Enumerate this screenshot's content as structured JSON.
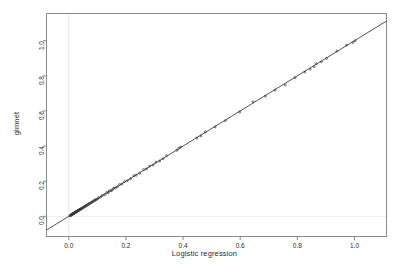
{
  "chart_data": {
    "type": "scatter",
    "title": "",
    "xlabel": "Logistic regression",
    "ylabel": "glmnet",
    "xticks": [
      "0.0",
      "0.2",
      "0.4",
      "0.6",
      "0.8",
      "1.0"
    ],
    "xtickvals": [
      0.0,
      0.2,
      0.4,
      0.6,
      0.8,
      1.0
    ],
    "yticks": [
      "0.0",
      "0.2",
      "0.4",
      "0.6",
      "0.8",
      "1.0"
    ],
    "ytickvals": [
      0.0,
      0.2,
      0.4,
      0.6,
      0.8,
      1.0
    ],
    "xlim": [
      -0.078,
      1.112
    ],
    "ylim": [
      -0.115,
      1.155
    ],
    "grid": false,
    "grid_reference_lines": [
      {
        "axis": "x",
        "value": 0.0,
        "color": "#e8e8e8"
      },
      {
        "axis": "y",
        "value": 0.0,
        "color": "#ededed"
      }
    ],
    "legend": null,
    "point_marker": "open-circle",
    "point_color": "#3a3a3a",
    "point_size_px": 2.0,
    "reference_line": {
      "label": "y = x identity line",
      "slope": 1,
      "intercept": 0,
      "color": "#2a2a2a",
      "width_px": 0.8
    },
    "frame_color": "#8a8a8a",
    "series": [
      {
        "name": "predicted probabilities",
        "x": [
          0.004,
          0.006,
          0.007,
          0.008,
          0.009,
          0.01,
          0.011,
          0.012,
          0.012,
          0.013,
          0.014,
          0.015,
          0.016,
          0.016,
          0.017,
          0.018,
          0.019,
          0.02,
          0.021,
          0.022,
          0.023,
          0.024,
          0.025,
          0.026,
          0.027,
          0.028,
          0.03,
          0.031,
          0.032,
          0.033,
          0.035,
          0.036,
          0.038,
          0.039,
          0.041,
          0.042,
          0.044,
          0.046,
          0.048,
          0.05,
          0.052,
          0.054,
          0.056,
          0.058,
          0.06,
          0.062,
          0.065,
          0.068,
          0.07,
          0.073,
          0.076,
          0.079,
          0.082,
          0.085,
          0.088,
          0.091,
          0.094,
          0.097,
          0.101,
          0.105,
          0.112,
          0.118,
          0.126,
          0.133,
          0.138,
          0.142,
          0.148,
          0.152,
          0.157,
          0.163,
          0.17,
          0.178,
          0.186,
          0.195,
          0.205,
          0.216,
          0.228,
          0.236,
          0.248,
          0.262,
          0.272,
          0.283,
          0.295,
          0.305,
          0.318,
          0.33,
          0.342,
          0.378,
          0.385,
          0.392,
          0.448,
          0.462,
          0.478,
          0.512,
          0.548,
          0.598,
          0.645,
          0.688,
          0.722,
          0.758,
          0.792,
          0.826,
          0.845,
          0.858,
          0.866,
          0.884,
          0.902,
          0.938,
          0.972,
          0.994,
          1.002
        ],
        "y": [
          0.003,
          0.005,
          0.006,
          0.008,
          0.009,
          0.01,
          0.01,
          0.011,
          0.013,
          0.012,
          0.013,
          0.015,
          0.015,
          0.017,
          0.016,
          0.018,
          0.019,
          0.019,
          0.022,
          0.021,
          0.024,
          0.023,
          0.026,
          0.025,
          0.028,
          0.027,
          0.029,
          0.032,
          0.031,
          0.034,
          0.034,
          0.037,
          0.037,
          0.04,
          0.04,
          0.043,
          0.043,
          0.045,
          0.049,
          0.049,
          0.051,
          0.055,
          0.055,
          0.059,
          0.059,
          0.063,
          0.064,
          0.067,
          0.072,
          0.072,
          0.075,
          0.08,
          0.081,
          0.084,
          0.09,
          0.09,
          0.095,
          0.096,
          0.1,
          0.107,
          0.11,
          0.12,
          0.124,
          0.136,
          0.134,
          0.145,
          0.146,
          0.15,
          0.16,
          0.161,
          0.168,
          0.181,
          0.184,
          0.198,
          0.203,
          0.214,
          0.231,
          0.234,
          0.245,
          0.266,
          0.27,
          0.286,
          0.292,
          0.308,
          0.315,
          0.328,
          0.345,
          0.376,
          0.388,
          0.395,
          0.446,
          0.458,
          0.481,
          0.509,
          0.545,
          0.594,
          0.652,
          0.684,
          0.719,
          0.748,
          0.79,
          0.822,
          0.838,
          0.852,
          0.869,
          0.88,
          0.899,
          0.941,
          0.975,
          0.99,
          1.0
        ]
      }
    ]
  },
  "figure": {
    "background": "#ffffff"
  }
}
